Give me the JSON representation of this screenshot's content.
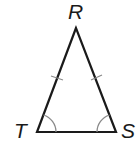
{
  "diagram": {
    "type": "isosceles-triangle",
    "vertices": {
      "R": {
        "label": "R",
        "x": 76,
        "y": 28
      },
      "T": {
        "label": "T",
        "x": 37,
        "y": 132
      },
      "S": {
        "label": "S",
        "x": 116,
        "y": 132
      }
    },
    "markings": {
      "congruent_sides": [
        "RT",
        "RS"
      ],
      "congruent_angles": [
        "T",
        "S"
      ]
    },
    "stroke_color": "#1a1a1a",
    "mark_color": "#8a8a8a"
  }
}
